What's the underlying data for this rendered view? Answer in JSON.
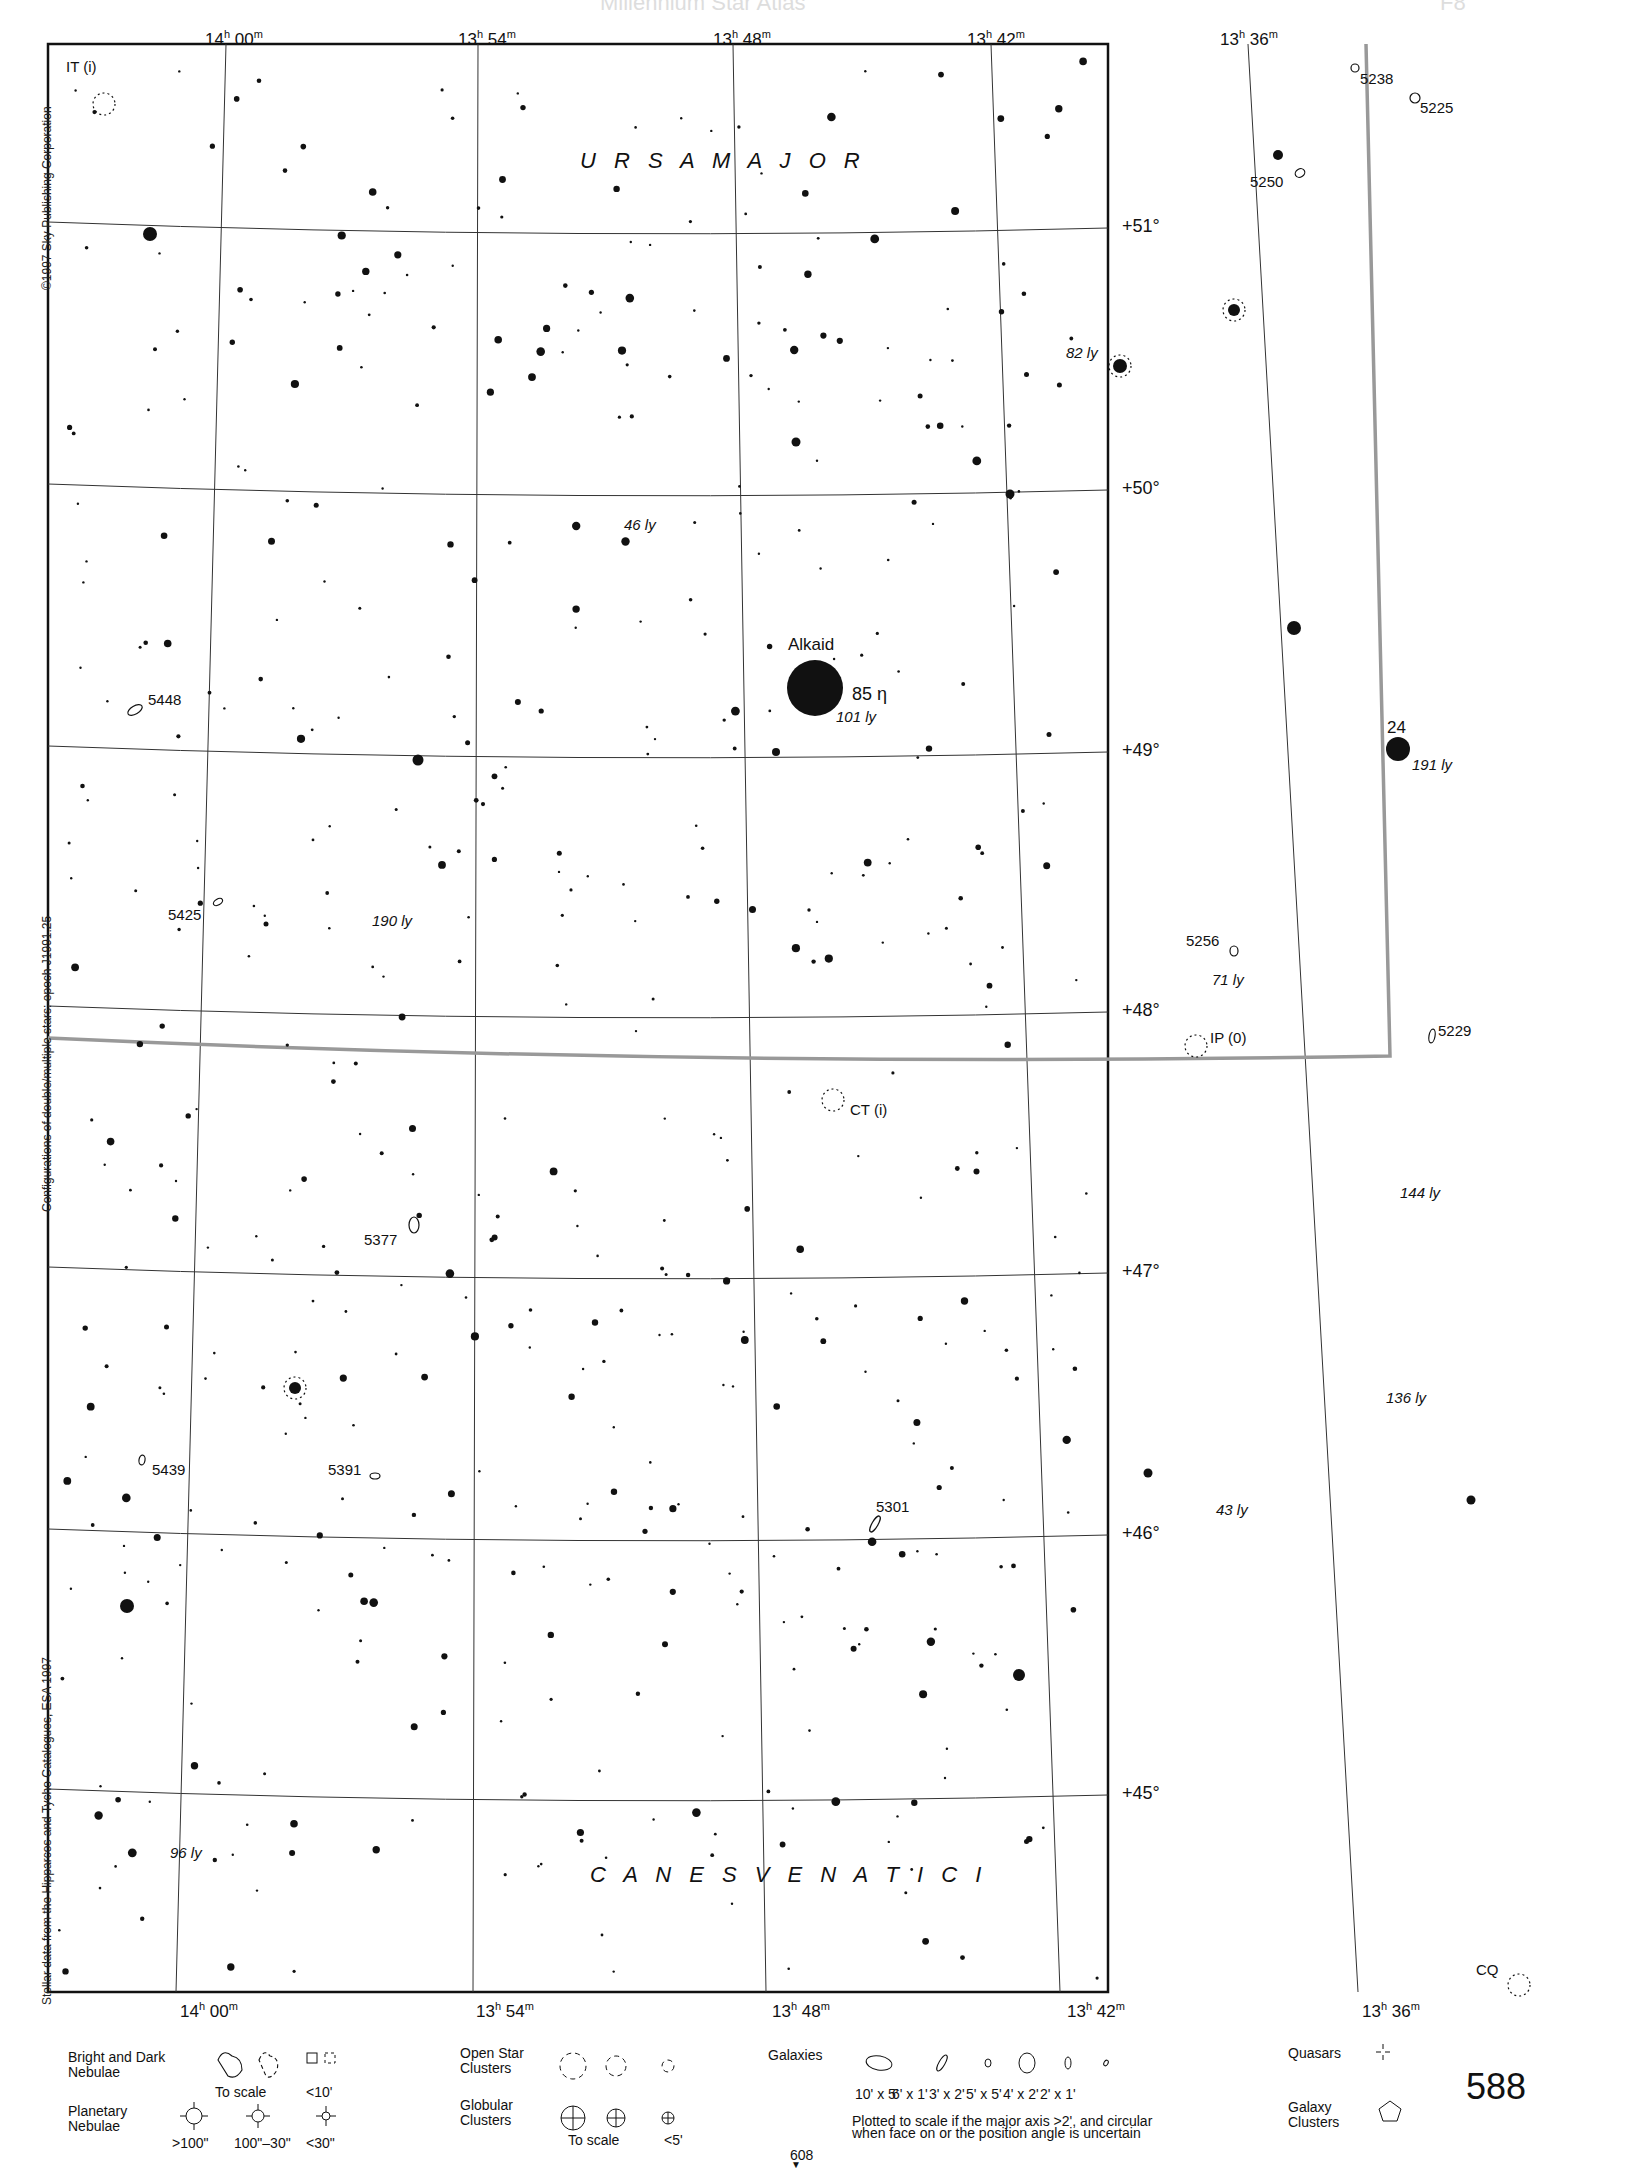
{
  "header": {
    "ghost_title": "Millennium Star Atlas",
    "ghost_page": "F8"
  },
  "credits": {
    "copyright": "©1997 Sky Publishing Corporation",
    "epoch": "Configurations of double/multiple stars: epoch J1991.25",
    "data_source": "Stellar data from the Hipparcos and Tycho Catalogues, ESA 1997"
  },
  "axes": {
    "ra_top": [
      {
        "h": "14",
        "m": "00",
        "x": 225
      },
      {
        "h": "13",
        "m": "54",
        "x": 478
      },
      {
        "h": "13",
        "m": "48",
        "x": 733
      },
      {
        "h": "13",
        "m": "42",
        "x": 987
      },
      {
        "h": "13",
        "m": "36",
        "x": 1240
      }
    ],
    "ra_bottom": [
      {
        "h": "14",
        "m": "00",
        "x": 176
      },
      {
        "h": "13",
        "m": "54",
        "x": 472
      },
      {
        "h": "13",
        "m": "48",
        "x": 768
      },
      {
        "h": "13",
        "m": "42",
        "x": 1063
      },
      {
        "h": "13",
        "m": "36",
        "x": 1358
      }
    ],
    "dec": [
      {
        "label": "+51°",
        "y": 228
      },
      {
        "label": "+50°",
        "y": 490
      },
      {
        "label": "+49°",
        "y": 752
      },
      {
        "label": "+48°",
        "y": 1012
      },
      {
        "label": "+47°",
        "y": 1273
      },
      {
        "label": "+46°",
        "y": 1535
      },
      {
        "label": "+45°",
        "y": 1795
      }
    ]
  },
  "constellations": [
    {
      "name": "U R S A   M A J O R",
      "x": 580,
      "y": 168
    },
    {
      "name": "C A N E S   V E N A T I C I",
      "x": 590,
      "y": 1882
    }
  ],
  "labeled_objects": [
    {
      "label": "Alkaid",
      "x": 788,
      "y": 650,
      "size": 17,
      "italic": false
    },
    {
      "label": "85 η",
      "x": 852,
      "y": 700,
      "size": 18,
      "italic": false
    },
    {
      "label": "101 ly",
      "x": 836,
      "y": 722,
      "size": 15,
      "italic": true
    },
    {
      "label": "24",
      "x": 1387,
      "y": 733,
      "size": 17,
      "italic": false
    },
    {
      "label": "191 ly",
      "x": 1412,
      "y": 770,
      "size": 15,
      "italic": true
    },
    {
      "label": "IT (i)",
      "x": 66,
      "y": 72,
      "size": 15,
      "italic": false
    },
    {
      "label": "5238",
      "x": 1360,
      "y": 84,
      "size": 15,
      "italic": false
    },
    {
      "label": "5225",
      "x": 1420,
      "y": 113,
      "size": 15,
      "italic": false
    },
    {
      "label": "5250",
      "x": 1250,
      "y": 187,
      "size": 15,
      "italic": false
    },
    {
      "label": "82 ly",
      "x": 1066,
      "y": 358,
      "size": 15,
      "italic": true
    },
    {
      "label": "46 ly",
      "x": 624,
      "y": 530,
      "size": 15,
      "italic": true
    },
    {
      "label": "5448",
      "x": 148,
      "y": 705,
      "size": 15,
      "italic": false
    },
    {
      "label": "5425",
      "x": 168,
      "y": 920,
      "size": 15,
      "italic": false
    },
    {
      "label": "190 ly",
      "x": 372,
      "y": 926,
      "size": 15,
      "italic": true
    },
    {
      "label": "5256",
      "x": 1186,
      "y": 946,
      "size": 15,
      "italic": false
    },
    {
      "label": "71 ly",
      "x": 1212,
      "y": 985,
      "size": 15,
      "italic": true
    },
    {
      "label": "IP (0)",
      "x": 1210,
      "y": 1043,
      "size": 15,
      "italic": false
    },
    {
      "label": "5229",
      "x": 1438,
      "y": 1036,
      "size": 15,
      "italic": false
    },
    {
      "label": "CT (i)",
      "x": 850,
      "y": 1115,
      "size": 15,
      "italic": false
    },
    {
      "label": "144 ly",
      "x": 1400,
      "y": 1198,
      "size": 15,
      "italic": true
    },
    {
      "label": "5377",
      "x": 364,
      "y": 1245,
      "size": 15,
      "italic": false
    },
    {
      "label": "136 ly",
      "x": 1386,
      "y": 1403,
      "size": 15,
      "italic": true
    },
    {
      "label": "5439",
      "x": 152,
      "y": 1475,
      "size": 15,
      "italic": false
    },
    {
      "label": "5391",
      "x": 328,
      "y": 1475,
      "size": 15,
      "italic": false
    },
    {
      "label": "5301",
      "x": 876,
      "y": 1512,
      "size": 15,
      "italic": false
    },
    {
      "label": "43 ly",
      "x": 1216,
      "y": 1515,
      "size": 15,
      "italic": true
    },
    {
      "label": "96 ly",
      "x": 170,
      "y": 1858,
      "size": 15,
      "italic": true
    },
    {
      "label": "CQ",
      "x": 1476,
      "y": 1975,
      "size": 15,
      "italic": false
    }
  ],
  "bright_stars": [
    {
      "x": 815,
      "y": 688,
      "r": 28
    },
    {
      "x": 1398,
      "y": 749,
      "r": 12
    },
    {
      "x": 150,
      "y": 234,
      "r": 7
    },
    {
      "x": 127,
      "y": 1606,
      "r": 7
    },
    {
      "x": 1120,
      "y": 366,
      "r": 7
    },
    {
      "x": 1234,
      "y": 310,
      "r": 6
    },
    {
      "x": 1294,
      "y": 628,
      "r": 7
    },
    {
      "x": 1019,
      "y": 1675,
      "r": 6
    },
    {
      "x": 295,
      "y": 1388,
      "r": 6
    },
    {
      "x": 418,
      "y": 760,
      "r": 5.5
    },
    {
      "x": 1278,
      "y": 155,
      "r": 5
    },
    {
      "x": 1010,
      "y": 494,
      "r": 4.5
    },
    {
      "x": 796,
      "y": 442,
      "r": 4.5
    },
    {
      "x": 1148,
      "y": 1473,
      "r": 4.5
    },
    {
      "x": 1471,
      "y": 1500,
      "r": 4.5
    }
  ],
  "small_stars_seed": 588,
  "legend": {
    "nebulae_title": "Bright and Dark\nNebulae",
    "nebulae_scale": "To scale",
    "nebulae_small": "<10'",
    "planetary_title": "Planetary\nNebulae",
    "planetary_sizes": [
      ">100\"",
      "100\"–30\"",
      "<30\""
    ],
    "open_title": "Open Star\nClusters",
    "globular_title": "Globular\nClusters",
    "globular_scale": "To scale",
    "globular_small": "<5'",
    "galaxies_title": "Galaxies",
    "galaxy_sizes": [
      "10' x 5'",
      "6' x 1'",
      "3' x 2'",
      "5' x 5'",
      "4' x 2'",
      "2' x 1'"
    ],
    "galaxy_note": "Plotted to scale if the major axis >2', and circular\nwhen face on or the position angle is uncertain",
    "quasars_title": "Quasars",
    "galaxy_clusters_title": "Galaxy\nClusters",
    "next_page": "608",
    "page_number": "588"
  }
}
